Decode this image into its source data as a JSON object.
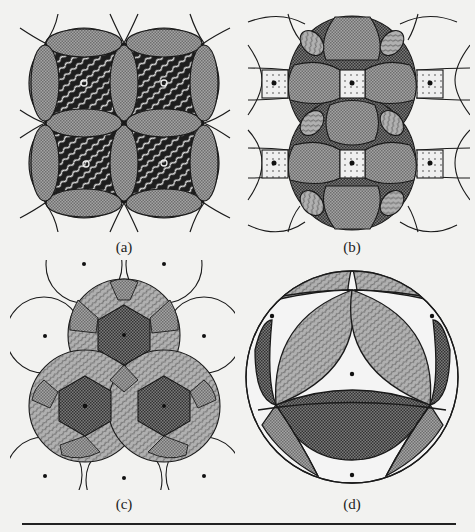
{
  "figure": {
    "panels": [
      {
        "id": "a",
        "label": "(a)",
        "description": "Four overlapping disks on a square lattice; wavy-hatched dark interiors with small open circles at centers; lens-shaped grey overlaps"
      },
      {
        "id": "b",
        "label": "(b)",
        "description": "Two large overlapping disks with crosshatched regions and dotted square cells with black dots at lattice points"
      },
      {
        "id": "c",
        "label": "(c)",
        "description": "Three overlapping disks on a triangular lattice with hexagonal crosshatched centers and black dots at lattice points"
      },
      {
        "id": "d",
        "label": "(d)",
        "description": "Single large circle with wavy-hatched and dark lens regions and four black dots"
      }
    ]
  },
  "colors": {
    "background": "#f2f2f0",
    "grey_fill": "#9a9a9a",
    "dark_fill": "#3a3a3a",
    "line": "#1a1a1a",
    "light_cell": "#e8e8e8"
  }
}
